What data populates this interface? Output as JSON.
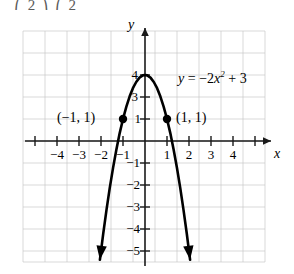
{
  "figure": {
    "cut_off_text_above": "⎛     2     ⎞ ⎛    2",
    "axis_labels": {
      "x": "x",
      "y": "y"
    },
    "equation_label": {
      "lhs": "y",
      "eq": "=",
      "coef": "−2",
      "var": "x",
      "exp": "2",
      "plus": "+",
      "const": "3"
    },
    "equation_plain": "y = −2x² + 3",
    "point_labels": [
      {
        "text": "(−1, 1)",
        "x": -1,
        "y": 1
      },
      {
        "text": "(1, 1)",
        "x": 1,
        "y": 1
      }
    ],
    "x_tick_labels": [
      "−4",
      "−3",
      "−2",
      "−1",
      "1",
      "2",
      "3",
      "4"
    ],
    "y_tick_labels": [
      "4",
      "3",
      "1",
      "−1",
      "−2",
      "−3",
      "−4",
      "−5"
    ]
  },
  "chart_data": {
    "type": "line",
    "title": "",
    "xlabel": "x",
    "ylabel": "y",
    "equation": "y = -2x^2 + 3",
    "xlim": [
      -5.5,
      5.5
    ],
    "ylim": [
      -6,
      5.5
    ],
    "grid": true,
    "legend": "none",
    "annotations": [
      {
        "text": "y = −2x² + 3",
        "x": 2.2,
        "y": 2.6
      },
      {
        "text": "(−1, 1)",
        "x": -2.6,
        "y": 1.0
      },
      {
        "text": "(1, 1)",
        "x": 1.6,
        "y": 1.0
      }
    ],
    "marked_points": [
      {
        "x": -1,
        "y": 1
      },
      {
        "x": 1,
        "y": 1
      }
    ],
    "vertex": {
      "x": 0,
      "y": 3
    },
    "x_ticks": [
      -4,
      -3,
      -2,
      -1,
      1,
      2,
      3,
      4
    ],
    "y_ticks": [
      4,
      3,
      1,
      -1,
      -2,
      -3,
      -4,
      -5
    ],
    "series": [
      {
        "name": "y = -2x^2 + 3",
        "x": [
          -2.05,
          -1.9,
          -1.75,
          -1.6,
          -1.45,
          -1.3,
          -1.15,
          -1.0,
          -0.85,
          -0.7,
          -0.55,
          -0.4,
          -0.25,
          -0.1,
          0,
          0.1,
          0.25,
          0.4,
          0.55,
          0.7,
          0.85,
          1.0,
          1.15,
          1.3,
          1.45,
          1.6,
          1.75,
          1.9,
          2.05
        ],
        "values": [
          -5.4,
          -4.22,
          -3.13,
          -2.12,
          -1.21,
          -0.38,
          0.36,
          1.0,
          1.55,
          2.02,
          2.4,
          2.68,
          2.88,
          2.98,
          3.0,
          2.98,
          2.88,
          2.68,
          2.4,
          2.02,
          1.55,
          1.0,
          0.36,
          -0.38,
          -1.21,
          -2.12,
          -3.13,
          -4.22,
          -5.4
        ]
      }
    ]
  }
}
